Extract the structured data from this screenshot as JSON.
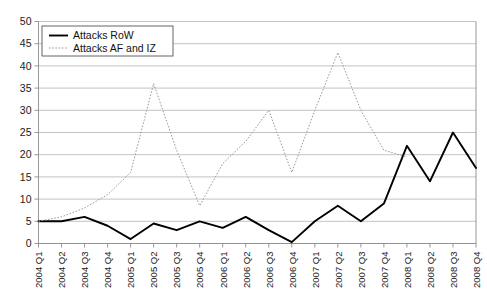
{
  "chart_data": {
    "type": "line",
    "title": "",
    "xlabel": "",
    "ylabel": "",
    "grid": true,
    "legend_position": "top-left",
    "ylim": [
      0,
      50
    ],
    "yticks": [
      0,
      5,
      10,
      15,
      20,
      25,
      30,
      35,
      40,
      45,
      50
    ],
    "categories": [
      "2004 Q1",
      "2004 Q2",
      "2004 Q3",
      "2004 Q4",
      "2005 Q1",
      "2005 Q2",
      "2005 Q3",
      "2005 Q4",
      "2006 Q1",
      "2006 Q2",
      "2006 Q3",
      "2006 Q4",
      "2007 Q1",
      "2007 Q2",
      "2007 Q3",
      "2007 Q4",
      "2008 Q1",
      "2008 Q2",
      "2008 Q3",
      "2008 Q4"
    ],
    "series": [
      {
        "name": "Attacks RoW",
        "style": "solid",
        "color": "#000000",
        "values": [
          5,
          5,
          6,
          4,
          1,
          4.5,
          3,
          5,
          3.5,
          6,
          3,
          0.3,
          5,
          8.5,
          5,
          9,
          22,
          14,
          25,
          17
        ]
      },
      {
        "name": "Attacks AF and IZ",
        "style": "dotted",
        "color": "#9a9a9a",
        "values": [
          5,
          6,
          8,
          11,
          16,
          36,
          21,
          8.5,
          18,
          23,
          30,
          16,
          30,
          43,
          30,
          21,
          19.5,
          null,
          null,
          null
        ]
      }
    ]
  },
  "legend": {
    "items": [
      {
        "label": "Attacks RoW",
        "style": "solid"
      },
      {
        "label": "Attacks AF and IZ",
        "style": "dotted"
      }
    ]
  }
}
